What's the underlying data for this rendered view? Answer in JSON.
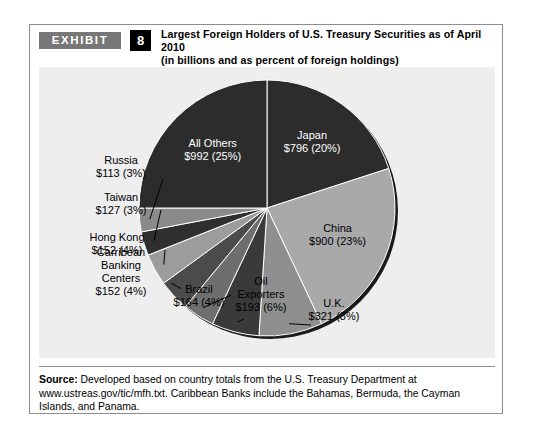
{
  "exhibit": {
    "badge_label": "EXHIBIT",
    "number": "8",
    "title": "Largest Foreign Holders of U.S. Treasury Securities as of April 2010",
    "subtitle": "(in billions and as percent of foreign holdings)"
  },
  "source": {
    "label": "Source:",
    "text": " Developed based on country totals from the U.S. Treasury Department at www.ustreas.gov/tic/mfh.txt. Caribbean Banks include the Bahamas, Bermuda, the Cayman Islands, and Panama."
  },
  "colors": {
    "panel_background": "#eeeeee",
    "figure_border": "#8d8d8d",
    "badge_background": "#777777",
    "number_background": "#000000",
    "slice_dark": "#2c2c2c",
    "slice_light": "#a9a9a9",
    "slice_mid_dark": "#4b4b4b",
    "slice_mid": "#6e6e6e",
    "pie_rim_shadow": "#1a1a1a"
  },
  "chart_data": {
    "type": "pie",
    "title": "Largest Foreign Holders of U.S. Treasury Securities as of April 2010",
    "subtitle": "(in billions and as percent of foreign holdings)",
    "value_unit": "USD billions",
    "start_angle_deg": 0,
    "direction": "clockwise",
    "legend": "none",
    "labels_inside": [
      "Japan",
      "China",
      "All Others"
    ],
    "categories": [
      "Japan",
      "China",
      "U.K.",
      "Oil Exporters",
      "Brazil",
      "Carribean Banking Centers",
      "Hong Kong",
      "Taiwan",
      "Russia",
      "All Others"
    ],
    "values": [
      796,
      900,
      321,
      193,
      164,
      152,
      152,
      127,
      113,
      992
    ],
    "percents": [
      20,
      23,
      8,
      6,
      4,
      4,
      4,
      3,
      3,
      25
    ],
    "slices": [
      {
        "name": "Japan",
        "label_line1": "Japan",
        "label_line2": "$796 (20%)",
        "value": 796,
        "percent": 20,
        "color": "#2c2c2c",
        "text_color": "#ffffff",
        "placement": "inside"
      },
      {
        "name": "China",
        "label_line1": "China",
        "label_line2": "$900 (23%)",
        "value": 900,
        "percent": 23,
        "color": "#a9a9a9",
        "text_color": "#000000",
        "placement": "inside"
      },
      {
        "name": "U.K.",
        "label_line1": "U.K.",
        "label_line2": "$321 (8%)",
        "value": 321,
        "percent": 8,
        "color": "#8f8f8f",
        "text_color": "#000000",
        "placement": "callout"
      },
      {
        "name": "Oil Exporters",
        "label_line1": "Oil",
        "label_line2": "Exporters",
        "label_line3": "$193 (6%)",
        "value": 193,
        "percent": 6,
        "color": "#3a3a3a",
        "text_color": "#000000",
        "placement": "callout"
      },
      {
        "name": "Brazil",
        "label_line1": "Brazil",
        "label_line2": "$164 (4%)",
        "value": 164,
        "percent": 4,
        "color": "#6e6e6e",
        "text_color": "#000000",
        "placement": "callout"
      },
      {
        "name": "Carribean Banking Centers",
        "label_line1": "Carribean",
        "label_line2": "Banking",
        "label_line3": "Centers",
        "label_line4": "$152 (4%)",
        "value": 152,
        "percent": 4,
        "color": "#4b4b4b",
        "text_color": "#000000",
        "placement": "callout"
      },
      {
        "name": "Hong Kong",
        "label_line1": "Hong Kong",
        "label_line2": "$152 (4%)",
        "value": 152,
        "percent": 4,
        "color": "#9c9c9c",
        "text_color": "#000000",
        "placement": "callout"
      },
      {
        "name": "Taiwan",
        "label_line1": "Taiwan",
        "label_line2": "$127 (3%)",
        "value": 127,
        "percent": 3,
        "color": "#2f2f2f",
        "text_color": "#000000",
        "placement": "callout"
      },
      {
        "name": "Russia",
        "label_line1": "Russia",
        "label_line2": "$113 (3%)",
        "value": 113,
        "percent": 3,
        "color": "#8a8a8a",
        "text_color": "#000000",
        "placement": "callout"
      },
      {
        "name": "All Others",
        "label_line1": "All Others",
        "label_line2": "$992 (25%)",
        "value": 992,
        "percent": 25,
        "color": "#2c2c2c",
        "text_color": "#ffffff",
        "placement": "inside"
      }
    ]
  }
}
